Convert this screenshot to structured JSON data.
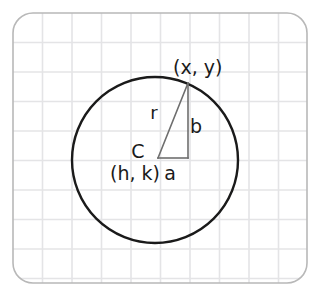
{
  "figure": {
    "kind": "geometry-diagram",
    "background_color": "#ffffff"
  },
  "card": {
    "name": "grid-card",
    "x": 13,
    "y": 13,
    "width": 294,
    "height": 270,
    "corner_radius": 20,
    "border_color": "#b8b8b8",
    "fill_color": "#ffffff"
  },
  "grid": {
    "spacing": 29.5,
    "line_color": "#e4e4e6",
    "line_width": 1.6,
    "visible": true
  },
  "circle": {
    "center_x": 155,
    "center_y": 160,
    "radius": 83,
    "stroke_color": "#1a1a1a",
    "stroke_width": 2.4,
    "fill": "none"
  },
  "triangle": {
    "stroke_color": "#6e6e6e",
    "stroke_width": 1.6,
    "vertex_center": {
      "x": 158,
      "y": 158
    },
    "vertex_corner": {
      "x": 188,
      "y": 158
    },
    "vertex_point": {
      "x": 188,
      "y": 83
    }
  },
  "labels": {
    "point_on_circle": {
      "text": "(x, y)",
      "x": 173,
      "y": 74,
      "font_size": 19
    },
    "radius": {
      "text": "r",
      "x": 154,
      "y": 119,
      "font_size": 18
    },
    "vertical_leg": {
      "text": "b",
      "x": 196,
      "y": 133,
      "font_size": 19
    },
    "horizontal_leg": {
      "text": "a",
      "x": 170,
      "y": 180,
      "font_size": 19
    },
    "center_marker": {
      "text": "C",
      "x": 138,
      "y": 158,
      "font_size": 19
    },
    "center_coordinates": {
      "text": "(h, k)",
      "x": 110,
      "y": 180,
      "font_size": 19
    }
  }
}
